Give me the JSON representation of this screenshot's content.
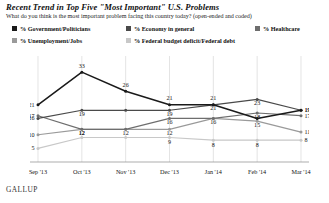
{
  "title": "Recent Trend in Top Five \"Most Important\" U.S. Problems",
  "subtitle": "What do you think is the most important problem facing this country today? (open-ended and coded)",
  "source": "GALLUP",
  "legend": [
    {
      "label": "% Government/Politicians",
      "color": "#1a1a1a"
    },
    {
      "label": "% Economy in general",
      "color": "#4a4a4a"
    },
    {
      "label": "% Healthcare",
      "color": "#6e6e6e"
    },
    {
      "label": "% Unemployment/Jobs",
      "color": "#9a9a9a"
    },
    {
      "label": "% Federal budget deficit/Federal debt",
      "color": "#c8c8c8"
    }
  ],
  "chart_data": {
    "type": "line",
    "title": "Recent Trend in Top Five \"Most Important\" U.S. Problems",
    "subtitle": "What do you think is the most important problem facing this country today? (open-ended and coded)",
    "xlabel": "",
    "ylabel": "",
    "ylim": [
      0,
      36
    ],
    "grid": "vertical",
    "legend_position": "top",
    "categories": [
      "Sep '13",
      "Oct '13",
      "Nov '13",
      "Dec '13",
      "Jan '14",
      "Feb '14",
      "Mar '14"
    ],
    "series": [
      {
        "name": "% Government/Politicians",
        "color": "#1a1a1a",
        "values": [
          21,
          33,
          26,
          21,
          21,
          16,
          19
        ]
      },
      {
        "name": "% Economy in general",
        "color": "#4a4a4a",
        "values": [
          16,
          19,
          19,
          19,
          21,
          23,
          19
        ]
      },
      {
        "name": "% Healthcare",
        "color": "#6e6e6e",
        "values": [
          17,
          12,
          12,
          16,
          16,
          18,
          17
        ]
      },
      {
        "name": "% Unemployment/Jobs",
        "color": "#9a9a9a",
        "values": [
          10,
          12,
          12,
          12,
          16,
          15,
          11
        ]
      },
      {
        "name": "% Federal budget deficit/Federal debt",
        "color": "#c8c8c8",
        "values": [
          5,
          9,
          9,
          9,
          8,
          8,
          8
        ]
      }
    ],
    "point_labels": {
      "government": [
        "21",
        "33",
        "26",
        "21",
        "21",
        "",
        "19"
      ],
      "economy": [
        "16",
        "19",
        "",
        "19",
        "21",
        "23",
        "19"
      ],
      "healthcare": [
        "17",
        "12",
        "",
        "16",
        "16",
        "18",
        "17"
      ],
      "unemployment": [
        "10",
        "12",
        "12",
        "12",
        "",
        "15",
        "11"
      ],
      "deficit": [
        "5",
        "",
        "",
        "9",
        "8",
        "8",
        "8"
      ]
    }
  }
}
